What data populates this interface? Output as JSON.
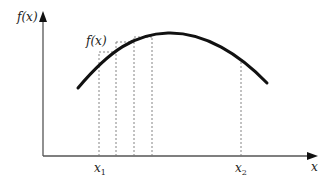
{
  "figure": {
    "y_axis_label": "f(x)",
    "x_axis_label": "x",
    "curve_label": "f(x)",
    "x1_label": "x",
    "x1_sub": "1",
    "x2_label": "x",
    "x2_sub": "2",
    "colors": {
      "axis": "#555555",
      "curve": "#111111",
      "dashed": "#777777",
      "background": "#ffffff"
    }
  },
  "diagram": {
    "type": "function-plot-with-rectangles",
    "rectangles": [
      {
        "x_left": 99,
        "x_right": 116,
        "top": 52
      },
      {
        "x_left": 116,
        "x_right": 134,
        "top": 42
      },
      {
        "x_left": 134,
        "x_right": 152,
        "top": 37
      }
    ]
  }
}
